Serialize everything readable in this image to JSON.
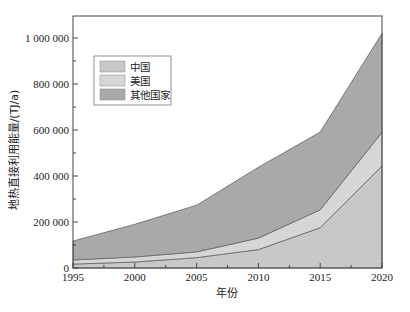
{
  "chart_data": {
    "type": "area",
    "stacked": true,
    "title": "",
    "xlabel": "年份",
    "ylabel": "地热直接利用能量/(TJ/a)",
    "x": [
      1995,
      2000,
      2005,
      2010,
      2015,
      2020
    ],
    "xlim": [
      1995,
      2020
    ],
    "ylim": [
      0,
      1100000
    ],
    "xticks": [
      "1995",
      "2000",
      "2005",
      "2010",
      "2015",
      "2020"
    ],
    "yticks": [
      "0",
      "200 000",
      "400 000",
      "600 000",
      "800 000",
      "1 000 000"
    ],
    "ytick_values": [
      0,
      200000,
      400000,
      600000,
      800000,
      1000000
    ],
    "grid": false,
    "legend_position": "upper left",
    "series": [
      {
        "name": "中国",
        "color": "#c8c8c8",
        "values": [
          17000,
          26000,
          45000,
          80000,
          175000,
          443000
        ]
      },
      {
        "name": "美国",
        "color": "#d6d6d6",
        "values": [
          18000,
          22000,
          25000,
          50000,
          78000,
          147000
        ]
      },
      {
        "name": "其他国家",
        "color": "#a9a9a9",
        "values": [
          82000,
          142000,
          203000,
          308000,
          338000,
          430000
        ]
      }
    ],
    "totals": [
      117000,
      190000,
      273000,
      438000,
      591000,
      1020000
    ]
  },
  "legend": {
    "items": [
      {
        "label": "中国",
        "color": "#c8c8c8"
      },
      {
        "label": "美国",
        "color": "#d6d6d6"
      },
      {
        "label": "其他国家",
        "color": "#a9a9a9"
      }
    ]
  }
}
